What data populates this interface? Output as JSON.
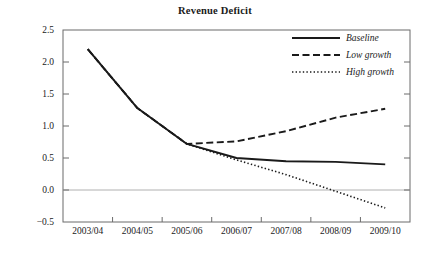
{
  "chart_data": {
    "type": "line",
    "title": "Revenue Deficit",
    "xlabel": "",
    "ylabel": "",
    "categories": [
      "2003/04",
      "2004/05",
      "2005/06",
      "2006/07",
      "2007/08",
      "2008/09",
      "2009/10"
    ],
    "series": [
      {
        "name": "Baseline",
        "style": "solid",
        "values": [
          2.2,
          1.28,
          0.72,
          0.5,
          0.45,
          0.44,
          0.4
        ]
      },
      {
        "name": "Low growth",
        "style": "dashed",
        "values": [
          2.2,
          1.28,
          0.72,
          0.76,
          0.92,
          1.13,
          1.27
        ]
      },
      {
        "name": "High growth",
        "style": "dotted",
        "values": [
          2.2,
          1.28,
          0.72,
          0.47,
          0.24,
          -0.02,
          -0.28
        ]
      }
    ],
    "ylim": [
      -0.5,
      2.5
    ],
    "yticks": [
      2.5,
      2.0,
      1.5,
      1.0,
      0.5,
      0.0,
      -0.5
    ],
    "ytick_labels": [
      "2.5",
      "2.0",
      "1.5",
      "1.0",
      "0.5",
      "0.0",
      "−0.5"
    ],
    "grid": false,
    "zero_line": true,
    "legend_position": "top-right",
    "line_color": "#1a1a1a",
    "frame_color": "#6b6b6b",
    "zero_line_color": "#b0b0b0"
  }
}
